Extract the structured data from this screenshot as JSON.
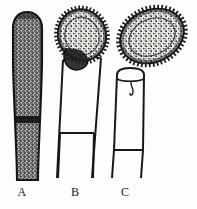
{
  "figure": {
    "background_color": "#fdfdfb",
    "ink_color": "#1a1a1a",
    "width": 197,
    "height": 209,
    "labels": [
      {
        "id": "a",
        "text": "A",
        "x": 22,
        "y": 192
      },
      {
        "id": "b",
        "text": "B",
        "x": 75,
        "y": 192
      },
      {
        "id": "c",
        "text": "C",
        "x": 125,
        "y": 192
      }
    ],
    "specimens": [
      {
        "id": "a",
        "label": "A",
        "description": "Elongated capsule with rounded apex, densely stippled interior, dark margins, constricting band near mid-length, extending into a long column",
        "bbox": [
          12,
          12,
          42,
          181
        ],
        "fill_style": "stippled",
        "outline_color": "#1a1a1a",
        "stipple_color": "#2b2b2b"
      },
      {
        "id": "b",
        "label": "B",
        "description": "Tilted ovoid spore head with radiating spiny fringe and stippled interior, attached atop a tapering open stalk bearing a horizontal cross-bar",
        "head_bbox": [
          58,
          10,
          106,
          62
        ],
        "stalk_bbox": [
          57,
          58,
          104,
          181
        ],
        "head_tilt_degrees": -18,
        "crossbar_y": 133,
        "fill_style": "stippled",
        "outline_color": "#1a1a1a"
      },
      {
        "id": "c",
        "label": "C",
        "description": "Detached tilted ovoid spore with radiating spiny fringe and stippled interior, shown above an empty cup-shaped stalk with apical rim line and horizontal cross-bar",
        "spore_bbox": [
          119,
          9,
          186,
          63
        ],
        "stalk_bbox": [
          110,
          68,
          152,
          181
        ],
        "spore_tilt_degrees": -25,
        "crossbar_y": 150,
        "fill_style": "stippled",
        "outline_color": "#1a1a1a"
      }
    ]
  }
}
